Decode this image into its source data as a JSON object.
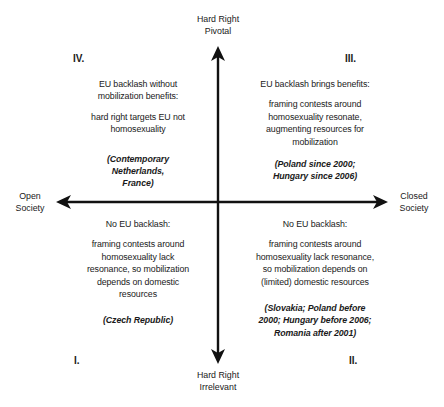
{
  "axes": {
    "top": [
      "Hard Right",
      "Pivotal"
    ],
    "bottom": [
      "Hard Right",
      "Irrelevant"
    ],
    "left": [
      "Open",
      "Society"
    ],
    "right": [
      "Closed",
      "Society"
    ]
  },
  "quadrants": {
    "IV": {
      "numeral": "IV.",
      "heading": [
        "EU backlash without",
        "mobilization benefits:"
      ],
      "body": [
        "hard right targets EU not",
        "homosexuality"
      ],
      "cases": [
        "(Contemporary",
        "Netherlands,",
        "France)"
      ]
    },
    "III": {
      "numeral": "III.",
      "heading": [
        "EU backlash brings benefits:"
      ],
      "body": [
        "framing contests around",
        "homosexuality resonate,",
        "augmenting resources for",
        "mobilization"
      ],
      "cases": [
        "(Poland since 2000;",
        "Hungary since 2006)"
      ]
    },
    "I": {
      "numeral": "I.",
      "heading": [
        "No EU backlash:"
      ],
      "body": [
        "framing contests around",
        "homosexuality lack",
        "resonance, so mobilization",
        "depends on domestic",
        "resources"
      ],
      "cases": [
        "(Czech Republic)"
      ]
    },
    "II": {
      "numeral": "II.",
      "heading": [
        "No EU backlash:"
      ],
      "body": [
        "framing contests around",
        "homosexuality lack resonance,",
        "so mobilization depends on",
        "(limited) domestic resources"
      ],
      "cases": [
        "(Slovakia; Poland before",
        "2000; Hungary before 2006;",
        "Romania after 2001)"
      ]
    }
  },
  "colors": {
    "ink": "#1a1a1a",
    "background": "#ffffff"
  }
}
